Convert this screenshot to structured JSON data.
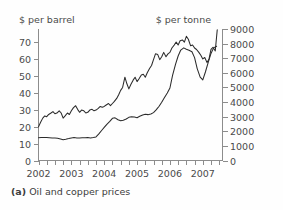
{
  "caption": {
    "label": "(a)",
    "text": "Oil and copper prices"
  },
  "chart_data": {
    "type": "line",
    "title": "Oil and copper prices",
    "xlabel": "",
    "ylabel": "$ per barrel",
    "y2label": "$ per tonne",
    "left_axis_title": "$ per barrel",
    "right_axis_title": "$ per tonne",
    "grid": false,
    "legend": "none",
    "xlim": [
      2002.0,
      2007.6
    ],
    "ylim": [
      0,
      78
    ],
    "y2lim": [
      0,
      9000
    ],
    "xticks": [
      2002,
      2003,
      2004,
      2005,
      2006,
      2007
    ],
    "xtick_labels": [
      "2002",
      "2003",
      "2004",
      "2005",
      "2006",
      "2007"
    ],
    "x_minor_tick_interval": 0.25,
    "yticks": [
      0,
      10,
      20,
      30,
      40,
      50,
      60,
      70
    ],
    "ytick_labels": [
      "0",
      "10",
      "20",
      "30",
      "40",
      "50",
      "60",
      "70"
    ],
    "y2ticks": [
      0,
      1000,
      2000,
      3000,
      4000,
      5000,
      6000,
      7000,
      8000,
      9000
    ],
    "y2tick_labels": [
      "0",
      "1000",
      "2000",
      "3000",
      "4000",
      "5000",
      "6000",
      "7000",
      "8000",
      "9000"
    ],
    "series": [
      {
        "name": "Oil price",
        "unit": "$ per barrel",
        "axis": "left",
        "color": "#2b2b2b",
        "x": [
          2002.0,
          2002.08,
          2002.17,
          2002.25,
          2002.33,
          2002.42,
          2002.5,
          2002.58,
          2002.67,
          2002.75,
          2002.83,
          2002.92,
          2003.0,
          2003.08,
          2003.17,
          2003.25,
          2003.33,
          2003.42,
          2003.5,
          2003.58,
          2003.67,
          2003.75,
          2003.83,
          2003.92,
          2004.0,
          2004.08,
          2004.17,
          2004.25,
          2004.33,
          2004.42,
          2004.5,
          2004.58,
          2004.67,
          2004.75,
          2004.83,
          2004.92,
          2005.0,
          2005.08,
          2005.17,
          2005.25,
          2005.33,
          2005.42,
          2005.5,
          2005.58,
          2005.67,
          2005.75,
          2005.83,
          2005.92,
          2006.0,
          2006.08,
          2006.17,
          2006.25,
          2006.33,
          2006.42,
          2006.5,
          2006.58,
          2006.67,
          2006.75,
          2006.83,
          2006.92,
          2007.0,
          2007.08,
          2007.17,
          2007.25,
          2007.33,
          2007.42
        ],
        "values": [
          13.5,
          13.6,
          13.6,
          13.6,
          13.5,
          13.4,
          13.3,
          13.2,
          12.8,
          12.3,
          12.6,
          13.0,
          13.4,
          13.6,
          13.4,
          13.3,
          13.5,
          13.5,
          13.6,
          13.4,
          13.6,
          14.0,
          15.6,
          17.8,
          19.6,
          21.4,
          23.2,
          25.0,
          25.3,
          24.2,
          23.6,
          23.9,
          24.6,
          25.6,
          26.0,
          25.8,
          25.4,
          26.2,
          27.0,
          27.4,
          27.2,
          27.6,
          28.4,
          30.0,
          32.2,
          34.6,
          37.2,
          40.0,
          43.0,
          50.5,
          57.0,
          62.0,
          65.5,
          66.8,
          66.0,
          65.4,
          64.5,
          61.0,
          54.5,
          49.5,
          47.8,
          52.5,
          58.5,
          63.5,
          66.8,
          67.8
        ]
      },
      {
        "name": "Copper price",
        "unit": "$ per tonne",
        "axis": "right",
        "color": "#2b2b2b",
        "x": [
          2002.0,
          2002.06,
          2002.13,
          2002.19,
          2002.25,
          2002.31,
          2002.38,
          2002.44,
          2002.5,
          2002.56,
          2002.63,
          2002.69,
          2002.75,
          2002.81,
          2002.88,
          2002.94,
          2003.0,
          2003.06,
          2003.13,
          2003.19,
          2003.25,
          2003.31,
          2003.38,
          2003.44,
          2003.5,
          2003.56,
          2003.63,
          2003.69,
          2003.75,
          2003.81,
          2003.88,
          2003.94,
          2004.0,
          2004.06,
          2004.13,
          2004.19,
          2004.25,
          2004.31,
          2004.38,
          2004.44,
          2004.5,
          2004.56,
          2004.63,
          2004.69,
          2004.75,
          2004.81,
          2004.88,
          2004.94,
          2005.0,
          2005.06,
          2005.13,
          2005.19,
          2005.25,
          2005.31,
          2005.38,
          2005.44,
          2005.5,
          2005.56,
          2005.63,
          2005.69,
          2005.75,
          2005.81,
          2005.88,
          2005.94,
          2006.0,
          2006.06,
          2006.13,
          2006.19,
          2006.25,
          2006.31,
          2006.38,
          2006.44,
          2006.5,
          2006.56,
          2006.63,
          2006.69,
          2006.75,
          2006.81,
          2006.88,
          2006.94,
          2007.0,
          2007.06,
          2007.13,
          2007.19,
          2007.25,
          2007.31,
          2007.38,
          2007.44
        ],
        "values": [
          2300,
          2600,
          2900,
          3050,
          3000,
          3150,
          3250,
          3350,
          3200,
          3250,
          3400,
          3250,
          2900,
          3050,
          3250,
          3150,
          3400,
          3600,
          3750,
          3500,
          3300,
          3450,
          3400,
          3250,
          3300,
          3450,
          3500,
          3400,
          3450,
          3550,
          3700,
          3650,
          3700,
          3800,
          3900,
          3750,
          3900,
          4050,
          4250,
          4500,
          4800,
          5000,
          5700,
          5250,
          4900,
          5200,
          5500,
          5700,
          5400,
          5600,
          5850,
          5900,
          5700,
          6000,
          6300,
          6500,
          6900,
          7300,
          7250,
          6900,
          7100,
          7400,
          7100,
          7300,
          7400,
          7700,
          7900,
          8100,
          7900,
          8200,
          8250,
          8100,
          8500,
          8300,
          7850,
          7900,
          7700,
          7600,
          7400,
          7200,
          6950,
          7050,
          6700,
          6950,
          7600,
          7750,
          7500,
          8950
        ]
      }
    ]
  }
}
